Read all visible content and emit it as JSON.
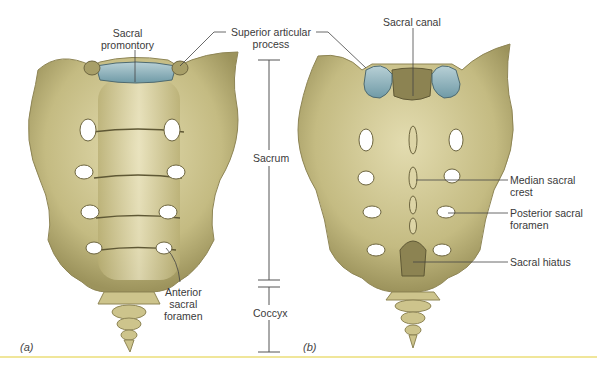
{
  "figure": {
    "panels": [
      {
        "id": "a",
        "label": "(a)",
        "view": "anterior"
      },
      {
        "id": "b",
        "label": "(b)",
        "view": "posterior"
      }
    ],
    "labels": {
      "sacral_promontory": [
        "Sacral",
        "promontory"
      ],
      "superior_articular_process": [
        "Superior articular",
        "process"
      ],
      "sacral_canal": "Sacral canal",
      "sacrum": "Sacrum",
      "coccyx": "Coccyx",
      "anterior_sacral_foramen": [
        "Anterior",
        "sacral",
        "foramen"
      ],
      "median_sacral_crest": [
        "Median sacral",
        "crest"
      ],
      "posterior_sacral_foramen": [
        "Posterior sacral",
        "foramen"
      ],
      "sacral_hiatus": "Sacral hiatus"
    },
    "colors": {
      "bone": "#c9c08a",
      "bone_shadow": "#9a9160",
      "cartilage": "#8fb0b8",
      "leader_line": "#444444",
      "footer_rule": "#f0e69a"
    }
  }
}
